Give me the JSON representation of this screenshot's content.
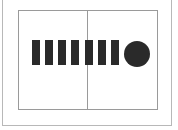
{
  "diagram": {
    "frame_color": "#b8b8b8",
    "box_color": "#9a9a9a",
    "shape_color": "#2a2a2a",
    "panels": [
      "left",
      "right"
    ],
    "bars": [
      {
        "index": 1,
        "x": 32
      },
      {
        "index": 2,
        "x": 45
      },
      {
        "index": 3,
        "x": 58
      },
      {
        "index": 4,
        "x": 71
      },
      {
        "index": 5,
        "x": 85
      },
      {
        "index": 6,
        "x": 98
      },
      {
        "index": 7,
        "x": 111
      }
    ],
    "bar_count": 7,
    "circle_count": 1
  }
}
